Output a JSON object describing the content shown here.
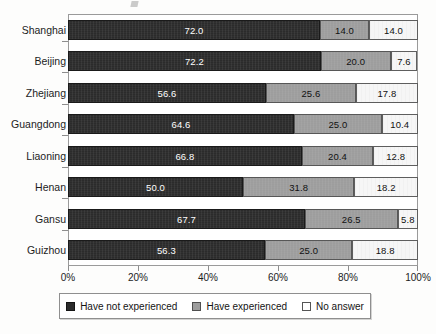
{
  "chart_data": {
    "type": "bar",
    "orientation": "horizontal",
    "stacked": true,
    "stack_mode": "percent",
    "title": "",
    "xlabel": "",
    "ylabel": "",
    "xlim": [
      0,
      100
    ],
    "grid": false,
    "legend_position": "bottom",
    "categories": [
      "Shanghai",
      "Beijing",
      "Zhejiang",
      "Guangdong",
      "Liaoning",
      "Henan",
      "Gansu",
      "Guizhou"
    ],
    "xticks": [
      0,
      20,
      40,
      60,
      80,
      100
    ],
    "xtick_labels": [
      "0%",
      "20%",
      "40%",
      "60%",
      "80%",
      "100%"
    ],
    "series": [
      {
        "name": "Have not experienced",
        "color": "#2b2b2b",
        "values": [
          72.0,
          72.2,
          56.6,
          64.6,
          66.8,
          50.0,
          67.7,
          56.3
        ],
        "labels": [
          "72.0",
          "72.2",
          "56.6",
          "64.6",
          "66.8",
          "50.0",
          "67.7",
          "56.3"
        ]
      },
      {
        "name": "Have experienced",
        "color": "#9d9d9d",
        "values": [
          14.0,
          20.0,
          25.6,
          25.0,
          20.4,
          31.8,
          26.5,
          25.0
        ],
        "labels": [
          "14.0",
          "20.0",
          "25.6",
          "25.0",
          "20.4",
          "31.8",
          "26.5",
          "25.0"
        ]
      },
      {
        "name": "No answer",
        "color": "#f6f6f6",
        "values": [
          14.0,
          7.6,
          17.8,
          10.4,
          12.8,
          18.2,
          5.8,
          18.8
        ],
        "labels": [
          "14.0",
          "7.6",
          "17.8",
          "10.4",
          "12.8",
          "18.2",
          "5.8",
          "18.8"
        ]
      }
    ]
  },
  "legend": {
    "items": [
      {
        "label": "Have not experienced"
      },
      {
        "label": "Have experienced"
      },
      {
        "label": "No answer"
      }
    ]
  }
}
